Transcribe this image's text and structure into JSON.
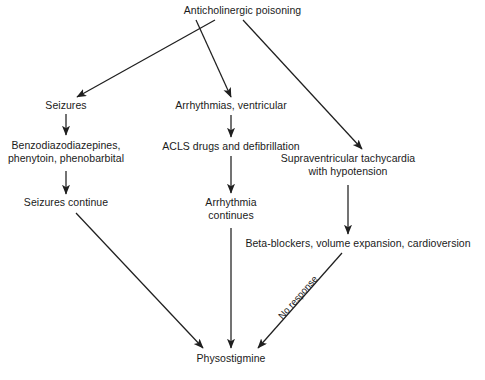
{
  "diagram": {
    "title_node": "Anticholinergic poisoning",
    "background_color": "#ffffff",
    "stroke_color": "#1f1f1f",
    "text_color": "#1a1a1a",
    "nodes": [
      {
        "id": "root",
        "lines": [
          "Anticholinergic poisoning"
        ]
      },
      {
        "id": "seizures",
        "lines": [
          "Seizures"
        ]
      },
      {
        "id": "benzo",
        "lines": [
          "Benzodiazodiazepines,",
          "phenytoin, phenobarbital"
        ]
      },
      {
        "id": "seizures_continue",
        "lines": [
          "Seizures continue"
        ]
      },
      {
        "id": "arrhythmias",
        "lines": [
          "Arrhythmias, ventricular"
        ]
      },
      {
        "id": "acls",
        "lines": [
          "ACLS drugs and defibrillation"
        ]
      },
      {
        "id": "arrhythmia_continues",
        "lines": [
          "Arrhythmia",
          "continues"
        ]
      },
      {
        "id": "svt",
        "lines": [
          "Supraventricular tachycardia",
          "with hypotension"
        ]
      },
      {
        "id": "beta",
        "lines": [
          "Beta-blockers, volume expansion, cardioversion"
        ]
      },
      {
        "id": "physostigmine",
        "lines": [
          "Physostigmine"
        ]
      }
    ],
    "edge_labels": [
      {
        "id": "no_response",
        "text": "No response"
      }
    ]
  }
}
